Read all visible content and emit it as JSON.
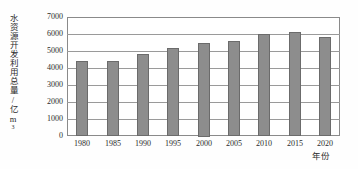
{
  "chart_data": {
    "type": "bar",
    "title": "",
    "subtitle": "",
    "xlabel": "年份",
    "ylabel": "水资源开发利用总量/亿m³",
    "ylabel_text": "水资源开发利用总量/亿m",
    "ylabel_superscript": "3",
    "categories": [
      "1980",
      "1985",
      "1990",
      "1995",
      "2000",
      "2005",
      "2010",
      "2015",
      "2020"
    ],
    "values": [
      4400,
      4400,
      4800,
      5200,
      5500,
      5600,
      6000,
      6100,
      5800
    ],
    "ylim": [
      0,
      7000
    ],
    "yticks": [
      0,
      1000,
      2000,
      3000,
      4000,
      5000,
      6000,
      7000
    ],
    "ytick_labels": [
      "0",
      "1000",
      "2000",
      "3000",
      "4000",
      "5000",
      "6000",
      "7000"
    ],
    "grid": true,
    "grid_axis": "y",
    "legend": false,
    "legend_position": "none",
    "bar_color": "#8d8d8d",
    "bar_edge_color": "#6b6b6b",
    "frame_color": "#8a8a8a",
    "grid_color": "#9a9a9a",
    "background_color": "#ffffff"
  }
}
